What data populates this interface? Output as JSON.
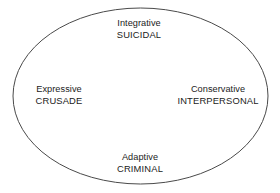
{
  "diagram": {
    "type": "ellipse-typology-map",
    "background_color": "#ffffff",
    "stroke_color": "#4a4a4a",
    "text_color": "#1b1b1b",
    "ellipse": {
      "center_x": 140.5,
      "center_y": 96,
      "radius_x": 127.5,
      "radius_y": 88,
      "stroke_width": 1,
      "fill": "none"
    },
    "labels": {
      "top": {
        "descriptor": "Integrative",
        "term": "SUICIDAL"
      },
      "left": {
        "descriptor": "Expressive",
        "term": "CRUSADE"
      },
      "right": {
        "descriptor": "Conservative",
        "term": "INTERPERSONAL"
      },
      "bottom": {
        "descriptor": "Adaptive",
        "term": "CRIMINAL"
      }
    }
  }
}
